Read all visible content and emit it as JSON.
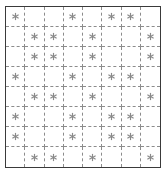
{
  "figure": {
    "type": "grid-pattern",
    "rows": 8,
    "columns": 8,
    "cell_mark": "asterisk",
    "mark_icon_name": "asterisk-icon",
    "outer_border_style": "solid",
    "inner_grid_style": "dashed",
    "colors": {
      "background": "#ffffff",
      "outer_border": "#3a3a3a",
      "inner_grid": "#8c8c8c",
      "mark": "#8a8a8a"
    }
  },
  "grid": {
    "marked_cells": [
      [
        true,
        false,
        false,
        true,
        false,
        true,
        true,
        false
      ],
      [
        false,
        true,
        true,
        false,
        true,
        false,
        false,
        true
      ],
      [
        false,
        true,
        true,
        false,
        true,
        false,
        false,
        true
      ],
      [
        true,
        false,
        false,
        true,
        false,
        true,
        true,
        false
      ],
      [
        false,
        true,
        true,
        false,
        true,
        false,
        false,
        true
      ],
      [
        true,
        false,
        false,
        true,
        false,
        true,
        true,
        false
      ],
      [
        true,
        false,
        false,
        true,
        false,
        true,
        true,
        false
      ],
      [
        false,
        true,
        true,
        false,
        true,
        false,
        false,
        true
      ]
    ],
    "marked_columns_by_row": [
      [
        1,
        4,
        6,
        7
      ],
      [
        2,
        3,
        5,
        8
      ],
      [
        2,
        3,
        5,
        8
      ],
      [
        1,
        4,
        6,
        7
      ],
      [
        2,
        3,
        5,
        8
      ],
      [
        1,
        4,
        6,
        7
      ],
      [
        1,
        4,
        6,
        7
      ],
      [
        2,
        3,
        5,
        8
      ]
    ],
    "total_marks": 32
  }
}
